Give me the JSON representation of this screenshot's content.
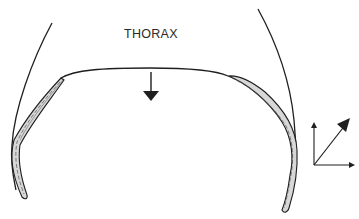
{
  "diagram": {
    "region_label": "THORAX",
    "colors": {
      "line": "#1f1f1f",
      "background": "#ffffff",
      "muscle_fill": "#d8d8d8"
    },
    "elements": [
      {
        "id": "thoracic-wall-left",
        "kind": "curve"
      },
      {
        "id": "thoracic-wall-right",
        "kind": "curve"
      },
      {
        "id": "diaphragm-dome",
        "kind": "curve"
      },
      {
        "id": "diaphragm-muscle-left",
        "kind": "band"
      },
      {
        "id": "diaphragm-muscle-right",
        "kind": "band"
      },
      {
        "id": "contraction-arrow",
        "kind": "arrow",
        "direction": "down"
      },
      {
        "id": "force-vector-diagram",
        "kind": "vectors",
        "components": [
          "vertical",
          "horizontal",
          "resultant-diagonal"
        ]
      }
    ]
  }
}
